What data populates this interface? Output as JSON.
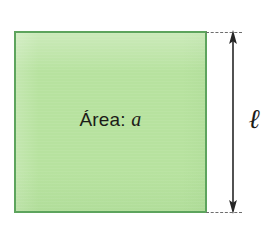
{
  "figure": {
    "type": "geometry-diagram",
    "shape": "square",
    "background_color": "#ffffff",
    "square": {
      "fill_color": "#b7e29f",
      "border_color": "#5da45d",
      "label_prefix": "Área:",
      "label_variable": "a"
    },
    "dimension": {
      "label": "ℓ",
      "orientation": "vertical",
      "arrow_color": "#262626",
      "guide_line_color": "#6d6d6d",
      "guide_line_style": "dashed"
    }
  }
}
